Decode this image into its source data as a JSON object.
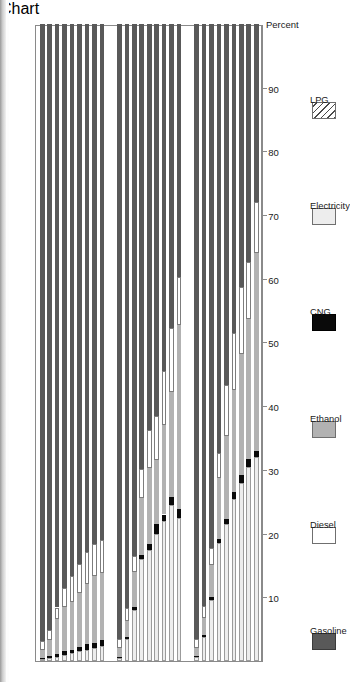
{
  "chart_data": {
    "type": "bar",
    "orientation": "horizontal-stacked",
    "title": "",
    "xlabel": "Percent",
    "ylabel": "",
    "xlim": [
      0,
      100
    ],
    "xticks": [
      90,
      80,
      70,
      60,
      50,
      40,
      30,
      20,
      10
    ],
    "grid": false,
    "legend_position": "bottom",
    "stack_order": [
      "Electricity",
      "CNG",
      "Ethanol",
      "Diesel",
      "Gasoline",
      "LPG"
    ],
    "legend": [
      {
        "label": "Gasoline",
        "color": "#595959",
        "pattern": "solid"
      },
      {
        "label": "Diesel",
        "color": "#ffffff",
        "pattern": "solid"
      },
      {
        "label": "Ethanol",
        "color": "#b2b2b2",
        "pattern": "solid"
      },
      {
        "label": "CNG",
        "color": "#0a0a0a",
        "pattern": "solid"
      },
      {
        "label": "Electricity",
        "color": "#ededed",
        "pattern": "solid"
      },
      {
        "label": "LPG",
        "color": "#ffffff",
        "pattern": "diagonal-hatch"
      }
    ],
    "groups": [
      {
        "name": "Business as usual",
        "categories": [
          "2010",
          "2015",
          "2020",
          "2025",
          "2030",
          "2035",
          "2040",
          "2045",
          "2050"
        ],
        "series": [
          {
            "name": "Electricity",
            "values": [
              0.3,
              0.5,
              0.7,
              1.0,
              1.2,
              1.5,
              1.8,
              2.0,
              2.3
            ]
          },
          {
            "name": "CNG",
            "values": [
              0.2,
              0.3,
              0.4,
              0.5,
              0.6,
              0.7,
              0.8,
              0.9,
              1.0
            ]
          },
          {
            "name": "Ethanol",
            "values": [
              1.2,
              2.5,
              5.5,
              7.0,
              7.5,
              8.5,
              9.5,
              10.5,
              10.5
            ]
          },
          {
            "name": "Diesel",
            "values": [
              1.5,
              1.6,
              1.8,
              3.0,
              4.0,
              4.5,
              5.0,
              5.0,
              5.2
            ]
          },
          {
            "name": "Gasoline",
            "values": [
              96.8,
              95.1,
              91.6,
              88.5,
              86.7,
              84.8,
              82.9,
              81.6,
              81.0
            ]
          },
          {
            "name": "LPG",
            "values": [
              0.0,
              0.0,
              0.0,
              0.0,
              0.0,
              0.0,
              0.0,
              0.0,
              0.0
            ]
          }
        ]
      },
      {
        "name": "Lieberman-Warner Case A",
        "categories": [
          "2010",
          "2015",
          "2020",
          "2025",
          "2030",
          "2035",
          "2040",
          "2045",
          "2050"
        ],
        "series": [
          {
            "name": "Electricity",
            "values": [
              0.5,
              3.5,
              8.0,
              16.0,
              17.5,
              20.0,
              22.0,
              24.5,
              22.5
            ]
          },
          {
            "name": "CNG",
            "values": [
              0.2,
              0.3,
              0.5,
              0.6,
              0.8,
              1.5,
              1.0,
              1.2,
              1.3
            ]
          },
          {
            "name": "Ethanol",
            "values": [
              1.3,
              2.5,
              5.5,
              9.0,
              12.0,
              10.0,
              14.0,
              16.5,
              29.0
            ]
          },
          {
            "name": "Diesel",
            "values": [
              1.5,
              2.0,
              2.5,
              4.5,
              6.0,
              7.0,
              8.5,
              10.0,
              7.5
            ]
          },
          {
            "name": "Gasoline",
            "values": [
              96.5,
              91.7,
              83.5,
              69.9,
              63.7,
              61.5,
              54.5,
              47.8,
              39.7
            ]
          },
          {
            "name": "LPG",
            "values": [
              0.0,
              0.0,
              0.0,
              0.0,
              0.0,
              0.0,
              0.0,
              0.0,
              0.0
            ]
          }
        ]
      },
      {
        "name": "Lieberman-Warner Case B",
        "categories": [
          "2010",
          "2015",
          "2020",
          "2025",
          "2030",
          "2035",
          "2040",
          "2045",
          "2050"
        ],
        "series": [
          {
            "name": "Electricity",
            "values": [
              0.6,
              3.8,
              9.5,
              18.5,
              21.5,
              25.5,
              28.0,
              30.5,
              32.0
            ]
          },
          {
            "name": "CNG",
            "values": [
              0.2,
              0.3,
              0.5,
              0.7,
              0.8,
              1.0,
              1.2,
              1.2,
              1.0
            ]
          },
          {
            "name": "Ethanol",
            "values": [
              1.3,
              2.6,
              5.0,
              9.5,
              13.0,
              16.0,
              19.0,
              22.0,
              31.0
            ]
          },
          {
            "name": "Diesel",
            "values": [
              1.4,
              2.0,
              2.8,
              4.0,
              8.0,
              9.0,
              10.5,
              9.0,
              8.0
            ]
          },
          {
            "name": "Gasoline",
            "values": [
              96.5,
              91.3,
              82.2,
              67.3,
              56.7,
              48.5,
              41.3,
              37.3,
              28.0
            ]
          },
          {
            "name": "LPG",
            "values": [
              0.0,
              0.0,
              0.0,
              0.0,
              0.0,
              0.0,
              0.0,
              0.0,
              0.0
            ]
          }
        ]
      }
    ]
  },
  "axis": {
    "percent_label": "Percent",
    "ticks": [
      "90",
      "80",
      "70",
      "60",
      "50",
      "40",
      "30",
      "20",
      "10"
    ]
  },
  "groups_labels": [
    "Business as usual",
    "Lieberman-Warner Case A",
    "Lieberman-Warner Case B"
  ],
  "legend_labels": [
    "Gasoline",
    "Diesel",
    "Ethanol",
    "CNG",
    "Electricity",
    "LPG"
  ]
}
